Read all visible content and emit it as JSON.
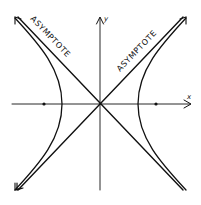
{
  "figure": {
    "type": "hyperbola",
    "ink_color": "#111111",
    "background": "#ffffff",
    "labels": {
      "asymptote_left": "ASYMPTOTE",
      "asymptote_right": "ASYMPTOTE",
      "y_axis": "y",
      "x_axis": "x"
    },
    "elements": [
      {
        "name": "x-axis",
        "kind": "axis"
      },
      {
        "name": "y-axis",
        "kind": "axis"
      },
      {
        "name": "asymptote-1",
        "kind": "line"
      },
      {
        "name": "asymptote-2",
        "kind": "line"
      },
      {
        "name": "left-branch",
        "kind": "curve"
      },
      {
        "name": "right-branch",
        "kind": "curve"
      },
      {
        "name": "left-focus",
        "kind": "point"
      },
      {
        "name": "right-focus",
        "kind": "point"
      }
    ]
  }
}
